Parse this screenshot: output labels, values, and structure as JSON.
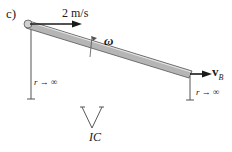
{
  "figure": {
    "part_label": "c)",
    "velocity_A_label": "2 m/s",
    "angular_velocity_label": "ω",
    "velocity_B_label": "v",
    "velocity_B_subscript": "B",
    "radius_left_label": "r → ∞",
    "radius_right_label": "r → ∞",
    "ic_label": "IC"
  },
  "colors": {
    "rod_fill": "#b5b5b5",
    "rod_edge": "#555555",
    "ink": "#1a1a1a"
  }
}
